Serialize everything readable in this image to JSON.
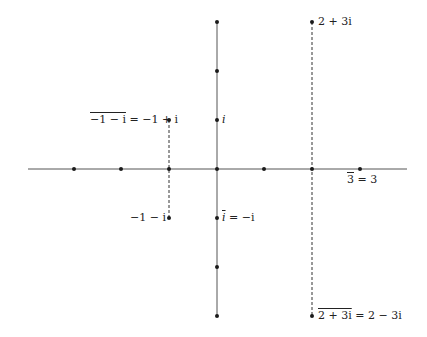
{
  "diagram": {
    "origin_px": [
      217,
      169
    ],
    "unit_px": 48,
    "colors": {
      "axis": "#555555",
      "point": "#1a1a1a",
      "dashed": "#333333",
      "background": "#ffffff"
    },
    "real_axis": {
      "x_from": 28,
      "x_to": 407
    },
    "imag_axis": {
      "y_from": 22,
      "y_to": 316
    },
    "axis_points": [
      {
        "re": -3,
        "im": 0
      },
      {
        "re": -2,
        "im": 0
      },
      {
        "re": -1,
        "im": 0
      },
      {
        "re": 0,
        "im": 0
      },
      {
        "re": 1,
        "im": 0
      },
      {
        "re": 2,
        "im": 0
      },
      {
        "re": 3,
        "im": 0
      },
      {
        "re": 0,
        "im": 3
      },
      {
        "re": 0,
        "im": 2
      },
      {
        "re": 0,
        "im": 1
      },
      {
        "re": 0,
        "im": -1
      },
      {
        "re": 0,
        "im": -2
      },
      {
        "re": 0,
        "im": -3
      }
    ],
    "conjugate_pairs": [
      {
        "from": {
          "re": 2,
          "im": 3
        },
        "to": {
          "re": 2,
          "im": -3
        }
      },
      {
        "from": {
          "re": -1,
          "im": 1
        },
        "to": {
          "re": -1,
          "im": -1
        }
      }
    ],
    "labels": {
      "two_plus_3i": "2 + 3i",
      "conj_two_plus_3i_bar": "2 + 3i",
      "conj_two_plus_3i_rest": " = 2 − 3i",
      "conj_neg1_minus_i_bar": "−1 − i",
      "conj_neg1_minus_i_rest": " = −1 + i",
      "neg1_minus_i": "−1 − i",
      "i": "i",
      "conj_i_bar": "i",
      "conj_i_rest": " = −i",
      "conj_3_bar": "3",
      "conj_3_rest": " = 3"
    }
  }
}
